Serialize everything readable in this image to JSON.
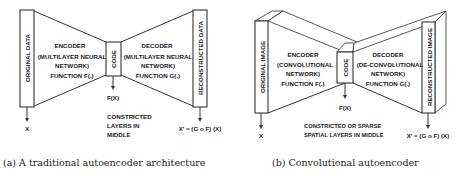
{
  "figure_a": {
    "input_label": "ORIGINAL DATA",
    "encoder": {
      "title": "ENCODER",
      "line1": "(MULTILAYER NEURAL",
      "line2": "NETWORK)",
      "line3": "FUNCTION  F(.)"
    },
    "code_label": "CODE",
    "code_output": "F(X)",
    "decoder": {
      "title": "DECODER",
      "line1": "(MULTILAYER NEURAL",
      "line2": "NETWORK)",
      "line3": "FUNCTION G(.)"
    },
    "output_label": "RECONSTRUCTED DATA",
    "input_var": "X",
    "middle_note": [
      "CONSTRICTED",
      "LAYERS IN",
      "MIDDLE"
    ],
    "output_formula": "X' = (G o F) (X)",
    "caption": "(a) A traditional autoencoder architecture"
  },
  "figure_b": {
    "input_label": "ORIGINAL IMAGE",
    "encoder": {
      "title": "ENCODER",
      "line1": "(CONVOLUTIONAL",
      "line2": "NETWORK)",
      "line3": "FUNCTION  F(.)"
    },
    "code_label": "CODE",
    "code_output": "F(X)",
    "decoder": {
      "title": "DECODER",
      "line1": "(DE-CONVOLUTIONAL",
      "line2": "NETWORK)",
      "line3": "FUNCTION G(.)"
    },
    "output_label": "RECONSTRUCTED IMAGE",
    "input_var": "X",
    "middle_note": [
      "CONSTRICTED OR SPARSE",
      "SPATIAL LAYERS IN MIDDLE"
    ],
    "output_formula": "X' = (G o F) (X)",
    "caption": "(b) Convolutional autoencoder"
  }
}
